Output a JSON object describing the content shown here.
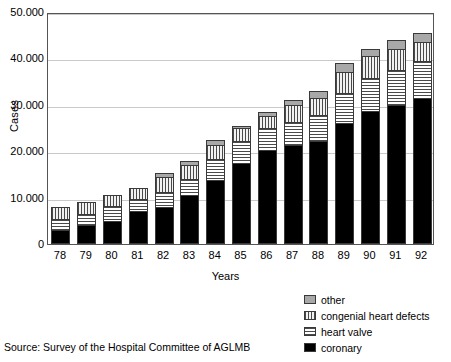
{
  "chart_data": {
    "type": "bar",
    "subtype": "stacked-bar",
    "title": "",
    "xlabel": "Years",
    "ylabel": "Cases",
    "categories": [
      "78",
      "79",
      "80",
      "81",
      "82",
      "83",
      "84",
      "85",
      "86",
      "87",
      "88",
      "89",
      "90",
      "91",
      "92"
    ],
    "ylim": [
      0,
      50000
    ],
    "yticks": [
      0,
      10000,
      20000,
      30000,
      40000,
      50000
    ],
    "ytick_labels": [
      "0",
      "10.000",
      "20.000",
      "30.000",
      "40.000",
      "50.000"
    ],
    "grid": true,
    "legend_position": "bottom-right",
    "series": [
      {
        "name": "coronary",
        "pattern": "solid",
        "color": "#000000",
        "values": [
          3000,
          4200,
          5000,
          7200,
          8000,
          10500,
          13800,
          17500,
          20200,
          21300,
          22300,
          26000,
          28700,
          30000,
          31500
        ]
      },
      {
        "name": "heart valve",
        "pattern": "horizontal-hatch",
        "color": "#ffffff",
        "values": [
          2500,
          2300,
          3200,
          2400,
          3200,
          3500,
          4600,
          4800,
          4800,
          5000,
          5500,
          6500,
          7000,
          7500,
          8000
        ]
      },
      {
        "name": "congenial heart defects",
        "pattern": "vertical-hatch",
        "color": "#f2f2f2",
        "values": [
          2500,
          2500,
          2300,
          2400,
          3300,
          3000,
          3000,
          2700,
          2500,
          3700,
          3700,
          4500,
          4800,
          4500,
          4000
        ]
      },
      {
        "name": "other",
        "pattern": "solid-gray",
        "color": "#a8a8a8",
        "values": [
          0,
          0,
          0,
          0,
          800,
          800,
          1100,
          500,
          1000,
          1000,
          1500,
          2000,
          1500,
          2000,
          2000
        ]
      }
    ],
    "totals": [
      8000,
      9000,
      10500,
      12000,
      15300,
      17800,
      22500,
      25500,
      28500,
      31000,
      33000,
      39000,
      42000,
      44000,
      45500
    ]
  },
  "legend": {
    "items": [
      {
        "label": "other"
      },
      {
        "label": "congenial heart defects"
      },
      {
        "label": "heart valve"
      },
      {
        "label": "coronary"
      }
    ]
  },
  "source": {
    "text": "Source: Survey of the Hospital Committee of AGLMB"
  }
}
